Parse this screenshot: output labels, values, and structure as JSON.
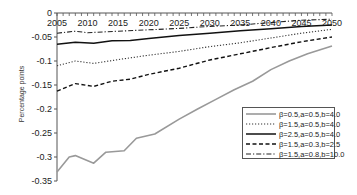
{
  "chart_data": {
    "type": "line",
    "title": "",
    "xlabel": "",
    "ylabel": "Percentage points",
    "xlim": [
      2005,
      2050
    ],
    "ylim": [
      -0.35,
      0
    ],
    "x_ticks": [
      "2005",
      "2010",
      "2015",
      "2020",
      "2025",
      "2030",
      "2035",
      "2040",
      "2045",
      "2050"
    ],
    "y_ticks": [
      "0",
      "-0.05",
      "-0.1",
      "-0.15",
      "-0.2",
      "-0.25",
      "-0.3",
      "-0.35"
    ],
    "grid": false,
    "legend_position": "lower right",
    "series": [
      {
        "name": "β=0.5,a=0.5,b=4.0",
        "style": "solid",
        "color": "#999999",
        "width": 1.6,
        "x": [
          2005,
          2007,
          2008,
          2011,
          2013,
          2016,
          2018,
          2021,
          2025,
          2028,
          2031,
          2034,
          2037,
          2040,
          2043,
          2046,
          2050
        ],
        "values": [
          -0.331,
          -0.3,
          -0.297,
          -0.313,
          -0.29,
          -0.287,
          -0.261,
          -0.252,
          -0.221,
          -0.2,
          -0.18,
          -0.16,
          -0.142,
          -0.118,
          -0.1,
          -0.085,
          -0.069
        ]
      },
      {
        "name": "β=1.5,a=0.5,b=4.0",
        "style": "dotted",
        "color": "#333333",
        "width": 1.1,
        "x": [
          2005,
          2008,
          2011,
          2015,
          2020,
          2025,
          2030,
          2035,
          2040,
          2045,
          2050
        ],
        "values": [
          -0.11,
          -0.1,
          -0.105,
          -0.097,
          -0.088,
          -0.08,
          -0.07,
          -0.062,
          -0.052,
          -0.042,
          -0.034
        ]
      },
      {
        "name": "β=2.5,a=0.5,b=4.0",
        "style": "solid",
        "color": "#111111",
        "width": 1.5,
        "x": [
          2005,
          2008,
          2011,
          2014,
          2017,
          2020,
          2025,
          2030,
          2035,
          2040,
          2045,
          2050
        ],
        "values": [
          -0.065,
          -0.061,
          -0.063,
          -0.058,
          -0.057,
          -0.053,
          -0.047,
          -0.042,
          -0.037,
          -0.033,
          -0.028,
          -0.025
        ]
      },
      {
        "name": "β=1.5,a=0.3,b=2.5",
        "style": "dashed",
        "color": "#111111",
        "width": 1.4,
        "x": [
          2005,
          2008,
          2011,
          2014,
          2017,
          2020,
          2025,
          2030,
          2035,
          2040,
          2045,
          2050
        ],
        "values": [
          -0.163,
          -0.147,
          -0.153,
          -0.142,
          -0.138,
          -0.128,
          -0.115,
          -0.098,
          -0.085,
          -0.072,
          -0.06,
          -0.05
        ]
      },
      {
        "name": "β=1.5,a=0.8,b=10.0",
        "style": "dashdot",
        "color": "#222222",
        "width": 1.1,
        "x": [
          2005,
          2008,
          2010,
          2015,
          2020,
          2025,
          2030,
          2035,
          2040,
          2045,
          2050
        ],
        "values": [
          -0.042,
          -0.038,
          -0.041,
          -0.038,
          -0.035,
          -0.032,
          -0.028,
          -0.025,
          -0.02,
          -0.015,
          -0.013
        ]
      }
    ]
  }
}
